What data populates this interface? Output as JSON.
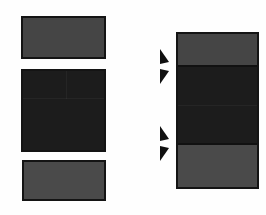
{
  "figure": {
    "title": "",
    "background_color": "#fefefe",
    "width": 266,
    "height": 215
  },
  "colors": {
    "outline": "#141414",
    "light_gray_fill": "#454545",
    "dark_fill": "#1c1c1c",
    "bottom_gray_fill": "#4a4a4a",
    "background": "#fefefe",
    "arrow_fill": "#101010"
  },
  "diagram": {
    "type": "exploded-assembly",
    "left_column": {
      "name": "exploded-components",
      "blocks": [
        {
          "id": "left-block-top",
          "label": "",
          "fill": "#454545",
          "x": 21,
          "y": 16,
          "width": 85,
          "height": 43
        },
        {
          "id": "left-block-middle",
          "label": "",
          "fill": "#1c1c1c",
          "x": 21,
          "y": 69,
          "width": 85,
          "height": 83
        },
        {
          "id": "left-block-bottom",
          "label": "",
          "fill": "#4a4a4a",
          "x": 22,
          "y": 160,
          "width": 84,
          "height": 41
        }
      ]
    },
    "right_column": {
      "name": "assembled-stack",
      "x": 176,
      "y": 32,
      "width": 83,
      "height": 157,
      "bands": [
        {
          "id": "stack-band-top",
          "label": "",
          "fill": "#454545",
          "offset": 0,
          "height": 33
        },
        {
          "id": "stack-band-middle",
          "label": "",
          "fill": "#1c1c1c",
          "offset": 33,
          "height": 78
        },
        {
          "id": "stack-band-bottom",
          "label": "",
          "fill": "#4a4a4a",
          "offset": 111,
          "height": 42
        }
      ]
    },
    "markers": [
      {
        "id": "arrow-marker-top",
        "icon": "double-arrowhead-icon",
        "label": "",
        "x": 157,
        "y": 47,
        "points_to": "stack-band-top/stack-band-middle boundary"
      },
      {
        "id": "arrow-marker-bottom",
        "icon": "double-arrowhead-icon",
        "label": "",
        "x": 157,
        "y": 124,
        "points_to": "stack-band-middle/stack-band-bottom boundary"
      }
    ]
  }
}
